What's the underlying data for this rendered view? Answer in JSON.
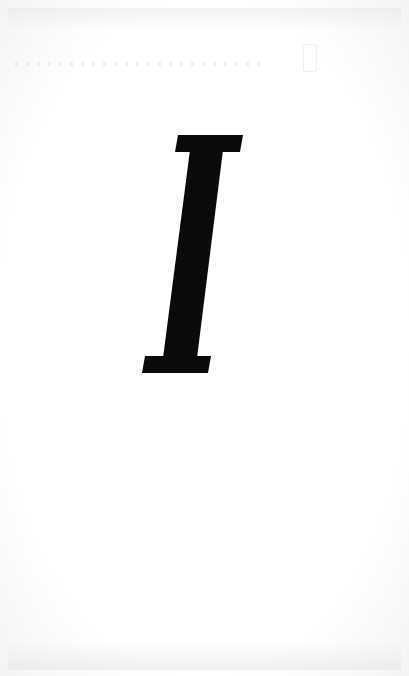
{
  "page": {
    "type": "scanned-page",
    "background_color": "#ffffff",
    "ink_color": "#0a0a0a"
  },
  "letter": {
    "character": "I",
    "style": "italic-serif-initial"
  }
}
